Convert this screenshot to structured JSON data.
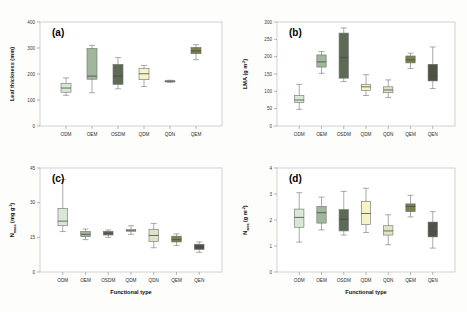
{
  "figure": {
    "background": "#fdfdfb",
    "xlabel": "Functional type",
    "categories_7": [
      "ODM",
      "OEM",
      "OSDM",
      "QDM",
      "QDN",
      "QEM",
      "QEN"
    ],
    "palette": {
      "ODM": "#d7e8d5",
      "OEM": "#9fb79a",
      "OSDM": "#5c6b55",
      "QDM": "#f4f4c6",
      "QDN": "#dfe4c4",
      "QEM": "#7d7f4e",
      "QEN": "#4f5345"
    }
  },
  "chart_data": [
    {
      "type": "box",
      "panel": "a",
      "tag": "(a)",
      "title": "",
      "xlabel": "",
      "ylabel": "Leaf thickness (mm)",
      "ylabel_main": "Leaf thickness (mm)",
      "ylim": [
        0,
        400
      ],
      "yticks": [
        0,
        100,
        200,
        300,
        400
      ],
      "grid": false,
      "categories": [
        "ODM",
        "OEM",
        "OSDM",
        "QDM",
        "QDN",
        "QEM"
      ],
      "boxes": [
        {
          "category": "ODM",
          "min": 118,
          "q1": 130,
          "median": 146,
          "q3": 163,
          "max": 185
        },
        {
          "category": "OEM",
          "min": 128,
          "q1": 180,
          "median": 192,
          "q3": 298,
          "max": 310
        },
        {
          "category": "OSDM",
          "min": 143,
          "q1": 160,
          "median": 192,
          "q3": 237,
          "max": 263
        },
        {
          "category": "QDM",
          "min": 152,
          "q1": 178,
          "median": 201,
          "q3": 222,
          "max": 233
        },
        {
          "category": "QDN",
          "min": 168,
          "q1": 170,
          "median": 172,
          "q3": 174,
          "max": 176
        },
        {
          "category": "QEM",
          "min": 255,
          "q1": 278,
          "median": 289,
          "q3": 302,
          "max": 313
        }
      ]
    },
    {
      "type": "box",
      "panel": "b",
      "tag": "(b)",
      "title": "",
      "xlabel": "",
      "ylabel": "LMA (g m-2)",
      "ylabel_main": "LMA (g m",
      "ylim": [
        0,
        300
      ],
      "yticks": [
        0,
        50,
        100,
        150,
        200,
        250,
        300
      ],
      "grid": false,
      "categories": [
        "ODM",
        "OEM",
        "OSDM",
        "QDM",
        "QDN",
        "QEM",
        "QEN"
      ],
      "boxes": [
        {
          "category": "ODM",
          "min": 48,
          "q1": 68,
          "median": 75,
          "q3": 88,
          "max": 120
        },
        {
          "category": "OEM",
          "min": 152,
          "q1": 170,
          "median": 185,
          "q3": 205,
          "max": 215
        },
        {
          "category": "OSDM",
          "min": 128,
          "q1": 138,
          "median": 198,
          "q3": 268,
          "max": 283
        },
        {
          "category": "QDM",
          "min": 88,
          "q1": 103,
          "median": 113,
          "q3": 120,
          "max": 148
        },
        {
          "category": "QDN",
          "min": 82,
          "q1": 96,
          "median": 104,
          "q3": 113,
          "max": 133
        },
        {
          "category": "QEM",
          "min": 166,
          "q1": 182,
          "median": 191,
          "q3": 202,
          "max": 210
        },
        {
          "category": "QEN",
          "min": 108,
          "q1": 130,
          "median": 146,
          "q3": 178,
          "max": 228
        }
      ]
    },
    {
      "type": "box",
      "panel": "c",
      "tag": "(c)",
      "title": "",
      "xlabel": "Functional type",
      "ylabel": "Nmass (mg g-1)",
      "ylabel_main": "N",
      "ylim": [
        0,
        45
      ],
      "yticks": [
        0,
        15,
        30,
        45
      ],
      "grid": false,
      "categories": [
        "ODM",
        "OEM",
        "OSDM",
        "QDM",
        "QDN",
        "QEM",
        "QEN"
      ],
      "boxes": [
        {
          "category": "ODM",
          "min": 17.5,
          "q1": 20.0,
          "median": 22.0,
          "q3": 27.5,
          "max": 40.0
        },
        {
          "category": "OEM",
          "min": 14.0,
          "q1": 15.3,
          "median": 16.3,
          "q3": 17.5,
          "max": 18.6
        },
        {
          "category": "OSDM",
          "min": 15.0,
          "q1": 16.0,
          "median": 16.8,
          "q3": 17.6,
          "max": 18.2
        },
        {
          "category": "QDM",
          "min": 16.3,
          "q1": 17.6,
          "median": 18.0,
          "q3": 18.4,
          "max": 20.0
        },
        {
          "category": "QDN",
          "min": 10.5,
          "q1": 13.2,
          "median": 15.8,
          "q3": 18.5,
          "max": 21.0
        },
        {
          "category": "QEM",
          "min": 11.5,
          "q1": 13.0,
          "median": 14.0,
          "q3": 15.5,
          "max": 16.5
        },
        {
          "category": "QEN",
          "min": 8.5,
          "q1": 9.8,
          "median": 10.8,
          "q3": 12.0,
          "max": 13.0
        }
      ]
    },
    {
      "type": "box",
      "panel": "d",
      "tag": "(d)",
      "title": "",
      "xlabel": "Functional type",
      "ylabel": "Narea (g m-2)",
      "ylabel_main": "N",
      "ylim": [
        0,
        4
      ],
      "yticks": [
        0,
        1,
        2,
        3,
        4
      ],
      "grid": false,
      "categories": [
        "ODM",
        "OEM",
        "OSDM",
        "QDM",
        "QDN",
        "QEM",
        "QEN"
      ],
      "boxes": [
        {
          "category": "ODM",
          "min": 1.15,
          "q1": 1.72,
          "median": 2.1,
          "q3": 2.42,
          "max": 3.05
        },
        {
          "category": "OEM",
          "min": 1.62,
          "q1": 1.88,
          "median": 2.28,
          "q3": 2.52,
          "max": 2.88
        },
        {
          "category": "OSDM",
          "min": 1.42,
          "q1": 1.58,
          "median": 2.02,
          "q3": 2.4,
          "max": 3.1
        },
        {
          "category": "QDM",
          "min": 1.52,
          "q1": 1.82,
          "median": 2.25,
          "q3": 2.72,
          "max": 3.22
        },
        {
          "category": "QDN",
          "min": 1.05,
          "q1": 1.42,
          "median": 1.58,
          "q3": 1.78,
          "max": 2.2
        },
        {
          "category": "QEM",
          "min": 2.12,
          "q1": 2.32,
          "median": 2.52,
          "q3": 2.62,
          "max": 2.95
        },
        {
          "category": "QEN",
          "min": 0.92,
          "q1": 1.35,
          "median": 1.55,
          "q3": 1.92,
          "max": 2.32
        }
      ]
    }
  ],
  "axis_labels": {
    "a_y": "Leaf thickness (mm)",
    "b_y_base": "LMA (g m",
    "b_y_sup": "-2",
    "b_y_close": ")",
    "c_y_base": "N",
    "c_y_sub": "mass",
    "c_y_unit": " (mg g",
    "c_y_sup": "-1",
    "c_y_close": ")",
    "d_y_base": "N",
    "d_y_sub": "area",
    "d_y_unit": " (g m",
    "d_y_sup": "-2",
    "d_y_close": ")"
  }
}
